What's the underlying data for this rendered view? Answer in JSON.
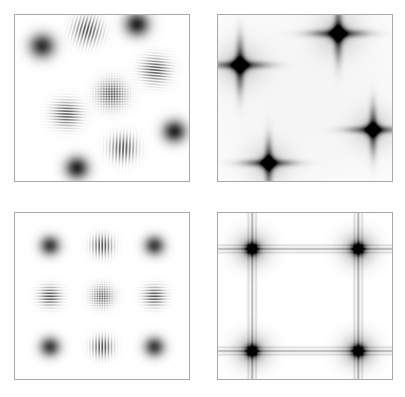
{
  "figure": {
    "width": 405,
    "height": 397,
    "background": "#ffffff",
    "panel_border_color": "#a8a8a8"
  },
  "chart_data": {
    "type": "heatmap",
    "title": "",
    "xlabel": "",
    "ylabel": "",
    "grid": false,
    "legend": null,
    "colormap": "gray_r",
    "value_range": [
      0,
      1
    ],
    "layout": {
      "rows": 2,
      "cols": 2
    },
    "panels": [
      {
        "id": "panel-top-left",
        "name": "random-gabor-patches",
        "row": 0,
        "col": 0,
        "bounds": {
          "x": 14,
          "y": 14,
          "width": 176,
          "height": 168
        },
        "axis_range": {
          "xlim": [
            0,
            1
          ],
          "ylim": [
            0,
            1
          ]
        },
        "ticks": {
          "x": [],
          "y": []
        },
        "render": "gabor-field",
        "patches": [
          {
            "x": 0.155,
            "y": 0.185,
            "sigma": 0.05,
            "freq": 0,
            "angle": 0,
            "amp": 0.8,
            "kind": "blob"
          },
          {
            "x": 0.415,
            "y": 0.09,
            "sigma": 0.052,
            "freq": 52,
            "angle": 15,
            "amp": 0.72,
            "kind": "grating"
          },
          {
            "x": 0.7,
            "y": 0.055,
            "sigma": 0.048,
            "freq": 0,
            "angle": 0,
            "amp": 0.85,
            "kind": "blob"
          },
          {
            "x": 0.805,
            "y": 0.33,
            "sigma": 0.052,
            "freq": 58,
            "angle": 95,
            "amp": 0.72,
            "kind": "grating"
          },
          {
            "x": 0.555,
            "y": 0.475,
            "sigma": 0.055,
            "freq": 46,
            "angle": 45,
            "amp": 0.78,
            "kind": "checker"
          },
          {
            "x": 0.295,
            "y": 0.595,
            "sigma": 0.052,
            "freq": 58,
            "angle": 92,
            "amp": 0.72,
            "kind": "grating"
          },
          {
            "x": 0.915,
            "y": 0.7,
            "sigma": 0.046,
            "freq": 0,
            "angle": 0,
            "amp": 0.85,
            "kind": "blob"
          },
          {
            "x": 0.62,
            "y": 0.8,
            "sigma": 0.05,
            "freq": 52,
            "angle": 2,
            "amp": 0.72,
            "kind": "grating"
          },
          {
            "x": 0.355,
            "y": 0.92,
            "sigma": 0.046,
            "freq": 0,
            "angle": 0,
            "amp": 0.85,
            "kind": "blob"
          }
        ]
      },
      {
        "id": "panel-top-right",
        "name": "random-diffraction-pattern",
        "row": 0,
        "col": 1,
        "bounds": {
          "x": 217,
          "y": 14,
          "width": 176,
          "height": 168
        },
        "axis_range": {
          "xlim": [
            0,
            1
          ],
          "ylim": [
            0,
            1
          ]
        },
        "ticks": {
          "x": [],
          "y": []
        },
        "render": "star-field",
        "stars": [
          {
            "x": 0.125,
            "y": 0.3,
            "core": 0.03,
            "arm": 0.165,
            "amp": 1.0
          },
          {
            "x": 0.69,
            "y": 0.11,
            "core": 0.03,
            "arm": 0.165,
            "amp": 1.0
          },
          {
            "x": 0.89,
            "y": 0.69,
            "core": 0.028,
            "arm": 0.15,
            "amp": 0.95
          },
          {
            "x": 0.29,
            "y": 0.89,
            "core": 0.028,
            "arm": 0.15,
            "amp": 0.95
          }
        ],
        "background_haze": 0.04
      },
      {
        "id": "panel-bottom-left",
        "name": "regular-gabor-grid",
        "row": 1,
        "col": 0,
        "bounds": {
          "x": 14,
          "y": 212,
          "width": 176,
          "height": 168
        },
        "axis_range": {
          "xlim": [
            0,
            1
          ],
          "ylim": [
            0,
            1
          ]
        },
        "ticks": {
          "x": [],
          "y": []
        },
        "render": "gabor-field",
        "grid": {
          "rows": 3,
          "cols": 3,
          "spacing_x": 0.3,
          "spacing_y": 0.305
        },
        "patches": [
          {
            "x": 0.2,
            "y": 0.195,
            "sigma": 0.04,
            "freq": 0,
            "angle": 0,
            "amp": 0.75,
            "kind": "blob"
          },
          {
            "x": 0.5,
            "y": 0.195,
            "sigma": 0.04,
            "freq": 56,
            "angle": 0,
            "amp": 0.75,
            "kind": "grating"
          },
          {
            "x": 0.8,
            "y": 0.195,
            "sigma": 0.04,
            "freq": 0,
            "angle": 0,
            "amp": 0.75,
            "kind": "blob"
          },
          {
            "x": 0.2,
            "y": 0.5,
            "sigma": 0.04,
            "freq": 56,
            "angle": 90,
            "amp": 0.75,
            "kind": "grating"
          },
          {
            "x": 0.5,
            "y": 0.5,
            "sigma": 0.042,
            "freq": 50,
            "angle": 45,
            "amp": 0.7,
            "kind": "checker"
          },
          {
            "x": 0.8,
            "y": 0.5,
            "sigma": 0.04,
            "freq": 56,
            "angle": 90,
            "amp": 0.75,
            "kind": "grating"
          },
          {
            "x": 0.2,
            "y": 0.805,
            "sigma": 0.04,
            "freq": 0,
            "angle": 0,
            "amp": 0.75,
            "kind": "blob"
          },
          {
            "x": 0.5,
            "y": 0.805,
            "sigma": 0.04,
            "freq": 56,
            "angle": 0,
            "amp": 0.75,
            "kind": "grating"
          },
          {
            "x": 0.8,
            "y": 0.805,
            "sigma": 0.04,
            "freq": 0,
            "angle": 0,
            "amp": 0.75,
            "kind": "blob"
          }
        ]
      },
      {
        "id": "panel-bottom-right",
        "name": "lattice-diffraction-pattern",
        "row": 1,
        "col": 1,
        "bounds": {
          "x": 217,
          "y": 212,
          "width": 176,
          "height": 168
        },
        "axis_range": {
          "xlim": [
            0,
            1
          ],
          "ylim": [
            0,
            1
          ]
        },
        "ticks": {
          "x": [],
          "y": []
        },
        "render": "lattice-field",
        "spots": [
          {
            "x": 0.195,
            "y": 0.215,
            "core": 0.026,
            "amp": 1.0
          },
          {
            "x": 0.805,
            "y": 0.215,
            "core": 0.026,
            "amp": 1.0
          },
          {
            "x": 0.195,
            "y": 0.83,
            "core": 0.026,
            "amp": 1.0
          },
          {
            "x": 0.805,
            "y": 0.83,
            "core": 0.026,
            "amp": 1.0
          }
        ],
        "vertical_lines": [
          0.195,
          0.805
        ],
        "horizontal_lines": [
          0.215,
          0.83
        ],
        "line_satellite_offsets": [
          -0.022,
          0.0,
          0.022
        ],
        "line_amp": 0.3
      }
    ]
  }
}
